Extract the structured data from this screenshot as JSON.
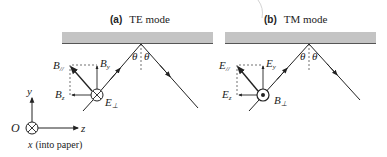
{
  "figure": {
    "panel_a": {
      "letter": "(a)",
      "title": "TE mode",
      "vector_parallel": "B",
      "vector_parallel_sub": "//",
      "vector_y": "B",
      "vector_y_sub": "y",
      "vector_z": "B",
      "vector_z_sub": "z",
      "vector_perp": "E",
      "vector_perp_sub": "⊥",
      "perp_symbol": "into-page",
      "angle_left": "θ",
      "angle_right": "θ"
    },
    "panel_b": {
      "letter": "(b)",
      "title": "TM mode",
      "vector_parallel": "E",
      "vector_parallel_sub": "//",
      "vector_y": "E",
      "vector_y_sub": "y",
      "vector_z": "E",
      "vector_z_sub": "z",
      "vector_perp": "B",
      "vector_perp_sub": "⊥",
      "perp_symbol": "out-of-page",
      "angle_left": "θ",
      "angle_right": "θ"
    },
    "axes": {
      "origin": "O",
      "y_label": "y",
      "z_label": "z",
      "x_label": "x",
      "x_note": "(into paper)"
    },
    "colors": {
      "mirror_fill": "#c4c4c4",
      "mirror_edge": "#555555",
      "line": "#222222"
    }
  }
}
